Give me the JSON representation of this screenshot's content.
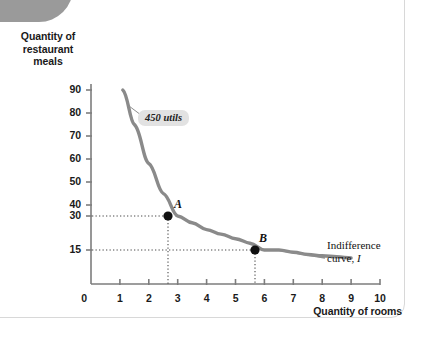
{
  "figure": {
    "y_axis_title": "Quantity of\nrestaurant\nmeals",
    "y_axis_title_lines": [
      "Quantity of",
      "restaurant",
      "meals"
    ],
    "x_axis_title": "Quantity of rooms",
    "callout_label": "450 utils",
    "curve_annotation_line1": "Indifference",
    "curve_annotation_line2": "curve, I",
    "curve_annotation_symbol": "I",
    "point_a_label": "A",
    "point_b_label": "B",
    "curve_color": "#8a8a8a",
    "point_color": "#111111",
    "badge_color": "#e2e2e2",
    "tab_color": "#9a9a9a",
    "frame_color": "#d8d8d8"
  },
  "chart_data": {
    "type": "line",
    "title": "",
    "subtitle": "",
    "xlabel": "Quantity of rooms",
    "ylabel": "Quantity of restaurant meals",
    "xlim": [
      0,
      11
    ],
    "ylim": [
      0,
      95
    ],
    "grid": false,
    "legend_position": "none",
    "x_ticks": [
      0,
      1,
      2,
      3,
      4,
      5,
      6,
      7,
      8,
      9,
      10
    ],
    "x_tick_labels": [
      "0",
      "1",
      "2",
      "3",
      "4",
      "5",
      "6",
      "7",
      "8",
      "9",
      "10"
    ],
    "y_ticks": [
      15,
      30,
      40,
      50,
      60,
      70,
      80,
      90
    ],
    "y_tick_labels": [
      "15",
      "30",
      "40",
      "50",
      "60",
      "70",
      "80",
      "90"
    ],
    "series": [
      {
        "name": "Indifference curve, I",
        "utility_level": 450,
        "relationship": "x * y = 450 (hyperbola, constant utility)",
        "x": [
          1.1,
          1.5,
          2,
          2.5,
          3,
          3.5,
          4,
          4.5,
          5,
          5.5,
          6,
          6.5,
          7,
          7.5,
          8,
          8.5,
          9
        ],
        "values": [
          90,
          75,
          58,
          45,
          30,
          27,
          24,
          22,
          20,
          18,
          15,
          15,
          14,
          13,
          12.5,
          12,
          11.5
        ]
      }
    ],
    "points": [
      {
        "label": "A",
        "x": 3,
        "y": 30
      },
      {
        "label": "B",
        "x": 6,
        "y": 15
      }
    ],
    "annotations": [
      {
        "text": "450 utils",
        "type": "callout",
        "target": "curve"
      },
      {
        "text": "Indifference curve, I",
        "type": "label",
        "target": "curve-right-end"
      }
    ]
  }
}
